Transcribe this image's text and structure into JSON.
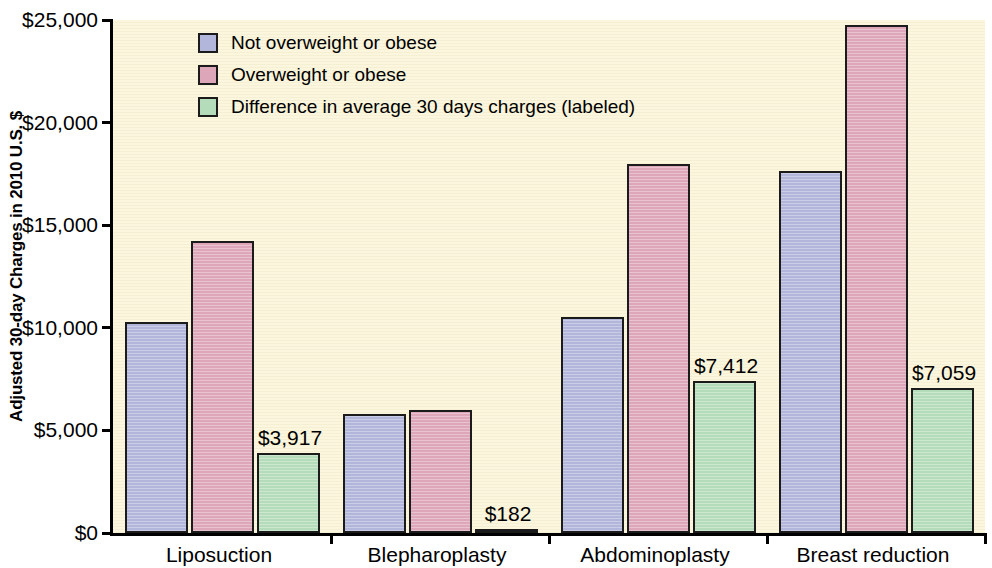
{
  "chart_data": {
    "type": "bar",
    "title": "",
    "subtitle": "",
    "xlabel": "",
    "ylabel": "Adjusted 30-day Charges in 2010 U.S. $",
    "ylim": [
      0,
      25000
    ],
    "ytick_labels": [
      "$0",
      "$5,000",
      "$10,000",
      "$15,000",
      "$20,000",
      "$25,000"
    ],
    "ytick_values": [
      0,
      5000,
      10000,
      15000,
      20000,
      25000
    ],
    "grid": false,
    "legend_position": "top-left-inside",
    "categories": [
      "Liposuction",
      "Blepharoplasty",
      "Abdominoplasty",
      "Breast reduction"
    ],
    "series": [
      {
        "name": "Not overweight or obese",
        "color": "#b2b6da",
        "values": [
          10280,
          5800,
          10530,
          17650
        ],
        "labels": [
          "",
          "",
          "",
          ""
        ]
      },
      {
        "name": "Overweight or obese",
        "color": "#dda7b9",
        "values": [
          14250,
          5980,
          17980,
          24750
        ],
        "labels": [
          "",
          "",
          "",
          ""
        ]
      },
      {
        "name": "Difference in average 30 days charges (labeled)",
        "color": "#b5dcba",
        "values": [
          3917,
          182,
          7412,
          7059
        ],
        "labels": [
          "$3,917",
          "$182",
          "$7,412",
          "$7,059"
        ]
      }
    ]
  },
  "legend": {
    "items": [
      {
        "label": "Not overweight or obese",
        "color": "#b2b6da"
      },
      {
        "label": "Overweight or obese",
        "color": "#dda7b9"
      },
      {
        "label": "Difference in average 30 days charges (labeled)",
        "color": "#b5dcba"
      }
    ]
  },
  "colors": {
    "plot_background": "#fbf6dd",
    "page_background": "#ffffff",
    "axis": "#000000",
    "bar_outline": "#1b1b1b",
    "not_overweight": "#b2b6da",
    "overweight": "#dda7b9",
    "difference": "#b5dcba"
  }
}
